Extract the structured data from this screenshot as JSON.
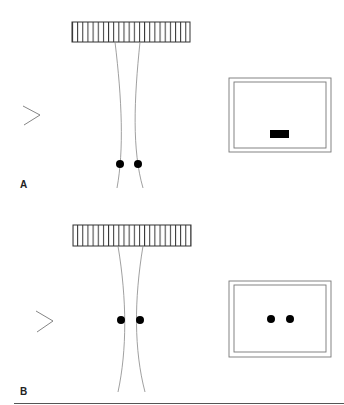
{
  "figure": {
    "panels": [
      {
        "label": "A",
        "description": "Grating with two converging lines; dots near bottom; screen shows a bar",
        "screen_content": "bar"
      },
      {
        "label": "B",
        "description": "Grating with two converging lines; dots at middle; screen shows two dots",
        "screen_content": "two-dots"
      }
    ],
    "colors": {
      "stroke": "#555555",
      "fill": "#000000",
      "background": "#ffffff"
    }
  }
}
